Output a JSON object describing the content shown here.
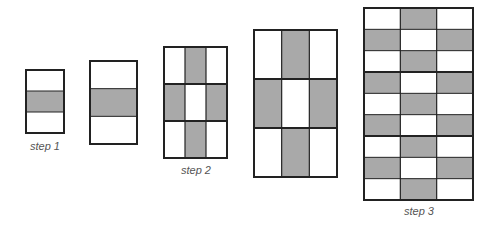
{
  "colors": {
    "fill": "#a9a9a9",
    "stroke": "#222222",
    "background": "#ffffff",
    "label": "#555555"
  },
  "figures": [
    {
      "id": "step1",
      "x": 26,
      "y": 70,
      "w": 38,
      "h": 63,
      "cols": 1,
      "rows": 3,
      "shaded": [
        [
          1,
          0
        ]
      ],
      "thick_rows": [],
      "thin_cols": [],
      "thin_rows": [
        1,
        2
      ]
    },
    {
      "id": "step1b",
      "x": 90,
      "y": 61,
      "w": 47,
      "h": 83,
      "cols": 1,
      "rows": 3,
      "shaded": [
        [
          1,
          0
        ]
      ],
      "thick_rows": [],
      "thin_cols": [],
      "thin_rows": [
        1,
        2
      ]
    },
    {
      "id": "step2",
      "x": 164,
      "y": 47,
      "w": 63,
      "h": 111,
      "cols": 3,
      "rows": 3,
      "shaded": [
        [
          0,
          1
        ],
        [
          1,
          0
        ],
        [
          1,
          2
        ],
        [
          2,
          1
        ]
      ],
      "thick_rows": [
        1,
        2
      ],
      "thin_cols": [
        1,
        2
      ],
      "thin_rows": []
    },
    {
      "id": "step2b",
      "x": 254,
      "y": 30,
      "w": 83,
      "h": 147,
      "cols": 3,
      "rows": 3,
      "shaded": [
        [
          0,
          1
        ],
        [
          1,
          0
        ],
        [
          1,
          2
        ],
        [
          2,
          1
        ]
      ],
      "thick_rows": [
        1,
        2
      ],
      "thin_cols": [
        1,
        2
      ],
      "thin_rows": []
    },
    {
      "id": "step3",
      "x": 364,
      "y": 8,
      "w": 109,
      "h": 192,
      "cols": 3,
      "rows": 9,
      "shaded": [
        [
          0,
          1
        ],
        [
          1,
          0
        ],
        [
          1,
          2
        ],
        [
          2,
          1
        ],
        [
          3,
          0
        ],
        [
          3,
          2
        ],
        [
          4,
          1
        ],
        [
          5,
          0
        ],
        [
          5,
          2
        ],
        [
          6,
          1
        ],
        [
          7,
          0
        ],
        [
          7,
          2
        ],
        [
          8,
          1
        ]
      ],
      "thick_rows": [
        3,
        6
      ],
      "thin_cols": [
        1,
        2
      ],
      "thin_rows": [
        1,
        2,
        4,
        5,
        7,
        8
      ]
    }
  ],
  "labels": [
    {
      "text": "step 1",
      "x": 45,
      "y": 140
    },
    {
      "text": "step 2",
      "x": 196,
      "y": 164
    },
    {
      "text": "step 3",
      "x": 419,
      "y": 205
    }
  ]
}
